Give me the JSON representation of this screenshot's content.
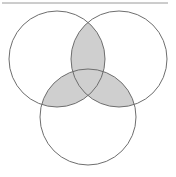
{
  "diagram": {
    "type": "venn",
    "set_count": 3,
    "sets": [
      {
        "id": "A",
        "position": "top-left",
        "cx": 57,
        "cy": 59,
        "r": 48
      },
      {
        "id": "B",
        "position": "top-right",
        "cx": 119,
        "cy": 59,
        "r": 48
      },
      {
        "id": "C",
        "position": "bottom",
        "cx": 88,
        "cy": 117,
        "r": 48
      }
    ],
    "shaded_regions": [
      "A∩B",
      "A∩C",
      "B∩C",
      "A∩B∩C"
    ],
    "colors": {
      "background": "#ffffff",
      "stroke": "#6e6e6e",
      "shade": "#cfcfcf",
      "top_rule": "#9a9a9a"
    }
  }
}
